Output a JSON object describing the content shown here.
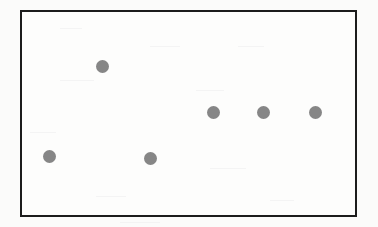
{
  "figure": {
    "background_color": "#fbfbfa",
    "width": 378,
    "height": 227,
    "title": "",
    "caption": ""
  },
  "frame": {
    "name": "plot-border",
    "x": 20,
    "y": 10,
    "width": 337,
    "height": 207,
    "border_color": "#1c1c1c",
    "border_width": 2,
    "fill_color": "#fdfdfc"
  },
  "marker_style": {
    "shape": "circle",
    "color": "#868686",
    "edge_color": "#868686",
    "diameter": 13
  },
  "chart_data": {
    "type": "scatter",
    "title": "",
    "subtitle": "",
    "xlabel": "",
    "ylabel": "",
    "xlim": [
      0,
      7
    ],
    "ylim": [
      0,
      7
    ],
    "grid": false,
    "legend": null,
    "legend_position": "none",
    "xticks": [],
    "yticks": [],
    "xticklabels": [],
    "yticklabels": [],
    "series": [
      {
        "name": "series-1",
        "color": "#868686",
        "marker": "o",
        "x": [
          1,
          2,
          3,
          4,
          5,
          6
        ],
        "y": [
          1,
          5,
          0.95,
          3.1,
          3.1,
          3.1
        ],
        "points_px": [
          {
            "cx": 49,
            "cy": 156
          },
          {
            "cx": 102,
            "cy": 66
          },
          {
            "cx": 150,
            "cy": 158
          },
          {
            "cx": 213,
            "cy": 112
          },
          {
            "cx": 263,
            "cy": 112
          },
          {
            "cx": 315,
            "cy": 112
          }
        ]
      }
    ],
    "annotations": []
  },
  "specks": [
    {
      "x": 60,
      "y": 28,
      "w": 22,
      "h": 1
    },
    {
      "x": 150,
      "y": 46,
      "w": 30,
      "h": 1
    },
    {
      "x": 238,
      "y": 46,
      "w": 26,
      "h": 1
    },
    {
      "x": 60,
      "y": 80,
      "w": 34,
      "h": 1
    },
    {
      "x": 196,
      "y": 90,
      "w": 28,
      "h": 1
    },
    {
      "x": 30,
      "y": 132,
      "w": 26,
      "h": 1
    },
    {
      "x": 210,
      "y": 168,
      "w": 36,
      "h": 1
    },
    {
      "x": 96,
      "y": 196,
      "w": 30,
      "h": 1
    },
    {
      "x": 270,
      "y": 200,
      "w": 24,
      "h": 1
    },
    {
      "x": 120,
      "y": 222,
      "w": 40,
      "h": 1
    }
  ]
}
